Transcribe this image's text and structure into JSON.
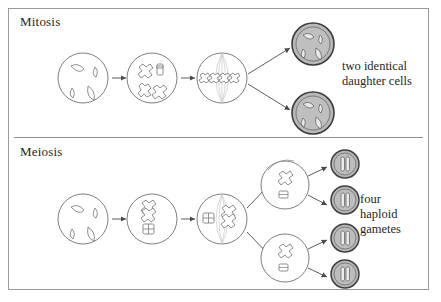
{
  "figure": {
    "kind": "biology-diagram",
    "title_mitosis": "Mitosis",
    "title_meiosis": "Meiosis",
    "caption_mitosis_line1": "two identical",
    "caption_mitosis_line2": "daughter cells",
    "caption_meiosis_line1": "four",
    "caption_meiosis_line2": "haploid",
    "caption_meiosis_line3": "gametes",
    "colors": {
      "frame_stroke": "#9a9a9a",
      "divider_stroke": "#8f8f8f",
      "cell_stroke": "#6f6f6f",
      "chromosome_stroke": "#7a7a7a",
      "spindle_stroke": "#c9c9c9",
      "product_fill": "#b8b8b8",
      "product_ring": "#3c3c3c",
      "arrow": "#4a4a4a",
      "text": "#262626",
      "background": "#ffffff"
    }
  },
  "mitosis": {
    "label": "Mitosis",
    "stages": [
      {
        "name": "interphase-cell",
        "chromosomes": 4,
        "style": "relaxed-threads"
      },
      {
        "name": "prophase-cell",
        "chromosomes": 4,
        "style": "condensed-duplicated"
      },
      {
        "name": "metaphase-cell",
        "chromosomes": 4,
        "style": "aligned-on-spindle"
      }
    ],
    "products": [
      {
        "name": "daughter-cell-top",
        "chromosomes": 4
      },
      {
        "name": "daughter-cell-bottom",
        "chromosomes": 4
      }
    ],
    "product_count": 2,
    "caption": "two identical daughter cells"
  },
  "meiosis": {
    "label": "Meiosis",
    "stages": [
      {
        "name": "interphase-cell",
        "chromosomes": 4,
        "style": "relaxed-threads"
      },
      {
        "name": "prophase-i-cell",
        "chromosomes": 4,
        "style": "paired-tetrads"
      },
      {
        "name": "metaphase-i-cell",
        "chromosomes": 4,
        "style": "tetrads-on-spindle"
      },
      {
        "name": "meiosis-ii-cell-top",
        "chromosomes": 2,
        "style": "condensed"
      },
      {
        "name": "meiosis-ii-cell-bottom",
        "chromosomes": 2,
        "style": "condensed"
      }
    ],
    "products": [
      {
        "name": "gamete-1",
        "chromosomes": 2
      },
      {
        "name": "gamete-2",
        "chromosomes": 2
      },
      {
        "name": "gamete-3",
        "chromosomes": 2
      },
      {
        "name": "gamete-4",
        "chromosomes": 2
      }
    ],
    "product_count": 4,
    "caption": "four haploid gametes"
  }
}
